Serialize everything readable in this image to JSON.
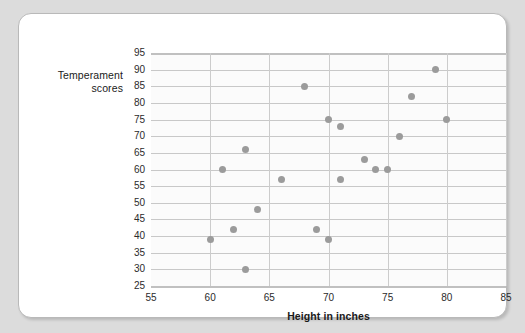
{
  "chart_data": {
    "type": "scatter",
    "title": "",
    "xlabel": "Height in inches",
    "ylabel": "Temperament scores",
    "xlim": [
      55,
      85
    ],
    "ylim": [
      25,
      95
    ],
    "xticks": [
      55,
      60,
      65,
      70,
      75,
      80,
      85
    ],
    "yticks": [
      25,
      30,
      35,
      40,
      45,
      50,
      55,
      60,
      65,
      70,
      75,
      80,
      85,
      90,
      95
    ],
    "grid": true,
    "legend": null,
    "point_color": "#9b9b9b",
    "grid_color": "#c8c8c8",
    "plot_background": "#fbfbfb",
    "points": [
      {
        "x": 60,
        "y": 39
      },
      {
        "x": 61,
        "y": 60
      },
      {
        "x": 62,
        "y": 42
      },
      {
        "x": 63,
        "y": 30
      },
      {
        "x": 63,
        "y": 66
      },
      {
        "x": 64,
        "y": 48
      },
      {
        "x": 66,
        "y": 57
      },
      {
        "x": 68,
        "y": 85
      },
      {
        "x": 69,
        "y": 42
      },
      {
        "x": 70,
        "y": 39
      },
      {
        "x": 70,
        "y": 75
      },
      {
        "x": 71,
        "y": 57
      },
      {
        "x": 71,
        "y": 73
      },
      {
        "x": 73,
        "y": 63
      },
      {
        "x": 74,
        "y": 60
      },
      {
        "x": 75,
        "y": 60
      },
      {
        "x": 76,
        "y": 70
      },
      {
        "x": 77,
        "y": 82
      },
      {
        "x": 79,
        "y": 90
      },
      {
        "x": 80,
        "y": 75
      }
    ]
  },
  "axes": {
    "y_title_line1": "Temperament",
    "y_title_line2": "scores",
    "x_title": "Height in inches"
  }
}
